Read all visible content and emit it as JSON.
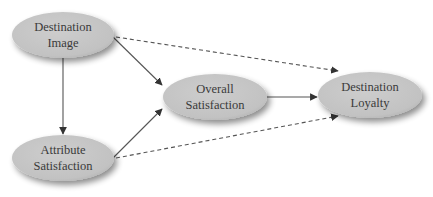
{
  "diagram": {
    "type": "path-model",
    "nodes": [
      {
        "id": "destination_image",
        "lines": [
          "Destination",
          "Image"
        ],
        "cx": 63,
        "cy": 35,
        "rx": 51,
        "ry": 23
      },
      {
        "id": "attribute_satisfaction",
        "lines": [
          "Attribute",
          "Satisfaction"
        ],
        "cx": 63,
        "cy": 158,
        "rx": 51,
        "ry": 23
      },
      {
        "id": "overall_satisfaction",
        "lines": [
          "Overall",
          "Satisfaction"
        ],
        "cx": 215,
        "cy": 97,
        "rx": 52,
        "ry": 23
      },
      {
        "id": "destination_loyalty",
        "lines": [
          "Destination",
          "Loyalty"
        ],
        "cx": 370,
        "cy": 95,
        "rx": 52,
        "ry": 23
      }
    ],
    "edges": [
      {
        "from": "destination_image",
        "to": "attribute_satisfaction",
        "style": "solid",
        "x1": 63,
        "y1": 58,
        "x2": 63,
        "y2": 134
      },
      {
        "from": "destination_image",
        "to": "overall_satisfaction",
        "style": "solid",
        "x1": 113,
        "y1": 37,
        "x2": 162,
        "y2": 85
      },
      {
        "from": "attribute_satisfaction",
        "to": "overall_satisfaction",
        "style": "solid",
        "x1": 113,
        "y1": 158,
        "x2": 162,
        "y2": 109
      },
      {
        "from": "overall_satisfaction",
        "to": "destination_loyalty",
        "style": "solid",
        "x1": 267,
        "y1": 97,
        "x2": 317,
        "y2": 97
      },
      {
        "from": "destination_image",
        "to": "destination_loyalty",
        "style": "dashed",
        "x1": 116,
        "y1": 37,
        "x2": 338,
        "y2": 71
      },
      {
        "from": "attribute_satisfaction",
        "to": "destination_loyalty",
        "style": "dashed",
        "x1": 116,
        "y1": 158,
        "x2": 338,
        "y2": 116
      }
    ],
    "colors": {
      "node_fill": "#c6c6c6",
      "node_shadow": "#9a9a9a",
      "text": "#3a3a3a",
      "edge": "#555555"
    }
  }
}
